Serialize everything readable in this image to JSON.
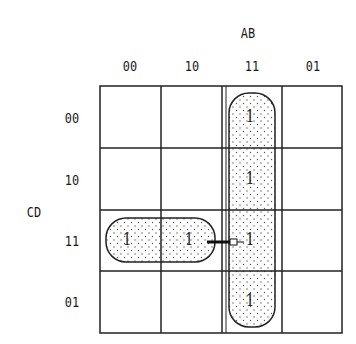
{
  "kmap": {
    "col_variable": "AB",
    "row_variable": "CD",
    "col_headers": [
      "00",
      "10",
      "11",
      "01"
    ],
    "row_headers": [
      "00",
      "10",
      "11",
      "01"
    ],
    "cells": [
      [
        "",
        "",
        "1",
        ""
      ],
      [
        "",
        "",
        "1",
        ""
      ],
      [
        "1",
        "1",
        "1",
        ""
      ],
      [
        "",
        "",
        "1",
        ""
      ]
    ],
    "groups": [
      {
        "name": "vertical-group",
        "cells": "column AB=11, all rows"
      },
      {
        "name": "horizontal-group",
        "cells": "row CD=11, columns AB=00,10"
      }
    ],
    "annotation": "arrow from horizontal group to vertical group"
  }
}
